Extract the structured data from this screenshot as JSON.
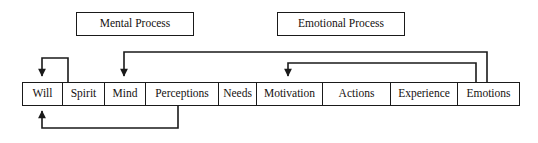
{
  "diagram": {
    "background_color": "#ffffff",
    "line_color": "#1a1a1a",
    "text_color": "#15110f"
  },
  "process_labels": [
    {
      "id": "mental",
      "text": "Mental Process"
    },
    {
      "id": "emotional",
      "text": "Emotional Process"
    }
  ],
  "stages": [
    {
      "label": "Will",
      "width": 40
    },
    {
      "label": "Spirit",
      "width": 42
    },
    {
      "label": "Mind",
      "width": 41
    },
    {
      "label": "Perceptions",
      "width": 73
    },
    {
      "label": "Needs",
      "width": 38
    },
    {
      "label": "Motivation",
      "width": 66
    },
    {
      "label": "Actions",
      "width": 68
    },
    {
      "label": "Experience",
      "width": 67
    },
    {
      "label": "Emotions",
      "width": 61
    }
  ],
  "connectors": [
    {
      "id": "spirit-to-will",
      "name": "spirit-to-will-feedback-arrow",
      "from": "Spirit",
      "to": "Will",
      "direction": "down",
      "path": "M 68 82 L 68 58 L 42 58 L 42 76"
    },
    {
      "id": "emotions-to-mind",
      "name": "emotions-to-mind-feedback-arrow",
      "from": "Emotions",
      "to": "Mind",
      "direction": "down",
      "path": "M 487 82 L 487 52 L 124 52 L 124 76"
    },
    {
      "id": "emotions-to-motivation",
      "name": "emotions-to-motivation-feedback-arrow",
      "from": "Emotions",
      "to": "Motivation",
      "direction": "down",
      "path": "M 476 82 L 476 63 L 288 63 L 288 76"
    },
    {
      "id": "perceptions-to-will",
      "name": "perceptions-to-will-feedback-arrow",
      "from": "Perceptions",
      "to": "Will",
      "direction": "up",
      "path": "M 178 106 L 178 128 L 42 128 L 42 111"
    }
  ]
}
